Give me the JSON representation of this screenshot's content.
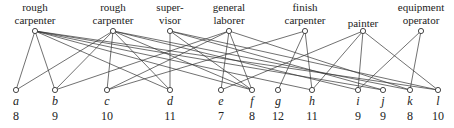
{
  "jobs": [
    {
      "id": "j1",
      "line1": "rough",
      "line2": "carpenter",
      "x": 35
    },
    {
      "id": "j2",
      "line1": "rough",
      "line2": "carpenter",
      "x": 113
    },
    {
      "id": "j3",
      "line1": "super-",
      "line2": "visor",
      "x": 170
    },
    {
      "id": "j4",
      "line1": "general",
      "line2": "laborer",
      "x": 229
    },
    {
      "id": "j5",
      "line1": "finish",
      "line2": "carpenter",
      "x": 305
    },
    {
      "id": "j6",
      "line1": "",
      "line2": "painter",
      "x": 363
    },
    {
      "id": "j7",
      "line1": "equipment",
      "line2": "operator",
      "x": 421
    }
  ],
  "applicants": [
    {
      "letter": "a",
      "score": "8",
      "x": 16
    },
    {
      "letter": "b",
      "score": "9",
      "x": 55
    },
    {
      "letter": "c",
      "score": "10",
      "x": 107
    },
    {
      "letter": "d",
      "score": "11",
      "x": 170
    },
    {
      "letter": "e",
      "score": "7",
      "x": 221
    },
    {
      "letter": "f",
      "score": "8",
      "x": 252
    },
    {
      "letter": "g",
      "score": "12",
      "x": 278
    },
    {
      "letter": "h",
      "score": "11",
      "x": 312
    },
    {
      "letter": "i",
      "score": "9",
      "x": 358
    },
    {
      "letter": "j",
      "score": "9",
      "x": 383
    },
    {
      "letter": "k",
      "score": "8",
      "x": 410
    },
    {
      "letter": "l",
      "score": "10",
      "x": 438
    }
  ],
  "edges": [
    [
      0,
      0
    ],
    [
      0,
      1
    ],
    [
      0,
      3
    ],
    [
      0,
      5
    ],
    [
      0,
      7
    ],
    [
      0,
      9
    ],
    [
      0,
      11
    ],
    [
      1,
      0
    ],
    [
      1,
      1
    ],
    [
      1,
      2
    ],
    [
      1,
      3
    ],
    [
      1,
      5
    ],
    [
      1,
      8
    ],
    [
      1,
      10
    ],
    [
      2,
      3
    ],
    [
      2,
      5
    ],
    [
      2,
      9
    ],
    [
      2,
      11
    ],
    [
      3,
      1
    ],
    [
      3,
      2
    ],
    [
      3,
      4
    ],
    [
      3,
      5
    ],
    [
      3,
      10
    ],
    [
      4,
      2
    ],
    [
      4,
      6
    ],
    [
      4,
      7
    ],
    [
      5,
      4
    ],
    [
      5,
      7
    ],
    [
      5,
      8
    ],
    [
      5,
      11
    ],
    [
      6,
      8
    ],
    [
      6,
      10
    ]
  ]
}
